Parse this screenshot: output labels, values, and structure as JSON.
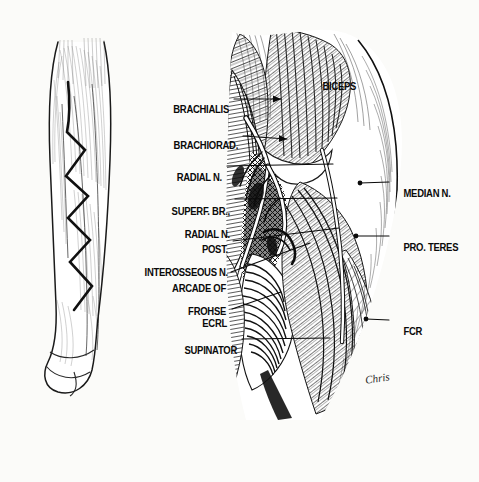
{
  "figure": {
    "background_color": "#fbfbf9",
    "ink_color": "#0a0a0a",
    "signature": "Chris"
  },
  "inset": {
    "name": "forearm-outline-with-incision",
    "description": "Outline drawing of right forearm, anterolateral view, showing planned zigzag (Bruner) skin incision"
  },
  "labels_left": [
    {
      "id": "brachialis",
      "text": "BRACHIALIS",
      "x": 229,
      "y": 98,
      "leader_to_x": 281,
      "leader_to_y": 99,
      "tip": "arrow"
    },
    {
      "id": "brachiorad",
      "text": "BRACHIORAD.",
      "x": 238,
      "y": 134,
      "leader_to_x": 287,
      "leader_to_y": 139,
      "tip": "arrow"
    },
    {
      "id": "radial-n",
      "text": "RADIAL N.",
      "x": 222,
      "y": 166,
      "leader_to_x": 333,
      "leader_to_y": 164,
      "tip": "plain"
    },
    {
      "id": "superf-br-radial-n",
      "text": "SUPERF. BR.,",
      "text2": "RADIAL N.",
      "x": 230,
      "y": 200,
      "leader_to_x": 337,
      "leader_to_y": 198,
      "tip": "plain"
    },
    {
      "id": "post-interosseous-n",
      "text": "POST.",
      "text2": "INTEROSSEOUS N.",
      "x": 228,
      "y": 238,
      "leader_to_x": 339,
      "leader_to_y": 228,
      "tip": "plain"
    },
    {
      "id": "arcade-of-frohse",
      "text": "ARCADE OF",
      "text2": "FROHSE",
      "x": 226,
      "y": 277,
      "leader_to_x": 310,
      "leader_to_y": 243,
      "tip": "plain"
    },
    {
      "id": "ecrl",
      "text": "ECRL",
      "x": 227,
      "y": 312,
      "leader_to_x": 281,
      "leader_to_y": 292,
      "tip": "plain"
    },
    {
      "id": "supinator",
      "text": "SUPINATOR",
      "x": 237,
      "y": 339,
      "leader_to_x": 330,
      "leader_to_y": 338,
      "tip": "plain"
    }
  ],
  "labels_right": [
    {
      "id": "biceps",
      "text": "BICEPS",
      "x": 313,
      "y": 75,
      "leader": false
    },
    {
      "id": "median-n",
      "text": "MEDIAN N.",
      "x": 394,
      "y": 181,
      "leader_to_x": 360,
      "leader_to_y": 183,
      "tip": "dot"
    },
    {
      "id": "pro-teres",
      "text": "PRO. TERES",
      "x": 394,
      "y": 235,
      "leader_to_x": 356,
      "leader_to_y": 236,
      "tip": "dot"
    },
    {
      "id": "fcr",
      "text": "FCR",
      "x": 394,
      "y": 320,
      "leader_to_x": 366,
      "leader_to_y": 319,
      "tip": "dot"
    }
  ]
}
